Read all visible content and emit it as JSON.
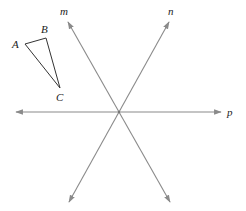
{
  "figure": {
    "colors": {
      "line": "#8a8a8a",
      "triangle": "#333333",
      "label": "#222222",
      "background": "#ffffff"
    },
    "intersection": {
      "x": 119,
      "y": 112
    },
    "lines": [
      {
        "name": "m",
        "label": "m",
        "from": {
          "x": 68,
          "y": 22
        },
        "to": {
          "x": 170,
          "y": 202
        },
        "label_pos": {
          "x": 60,
          "y": 15
        }
      },
      {
        "name": "n",
        "label": "n",
        "from": {
          "x": 169,
          "y": 22
        },
        "to": {
          "x": 69,
          "y": 202
        },
        "label_pos": {
          "x": 168,
          "y": 15
        }
      },
      {
        "name": "p",
        "label": "p",
        "from": {
          "x": 16,
          "y": 112
        },
        "to": {
          "x": 221,
          "y": 112
        },
        "label_pos": {
          "x": 227,
          "y": 116
        }
      }
    ],
    "triangle": {
      "vertices": [
        {
          "label": "A",
          "x": 25,
          "y": 44,
          "label_pos": {
            "x": 12,
            "y": 48
          }
        },
        {
          "label": "B",
          "x": 46,
          "y": 38,
          "label_pos": {
            "x": 41,
            "y": 33
          }
        },
        {
          "label": "C",
          "x": 60,
          "y": 88,
          "label_pos": {
            "x": 56,
            "y": 101
          }
        }
      ]
    }
  }
}
